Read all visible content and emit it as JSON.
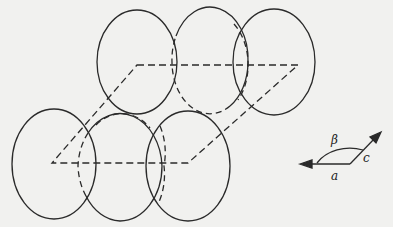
{
  "diagram": {
    "colors": {
      "background": "#f1f1ef",
      "stroke": "#2a2a2a"
    },
    "ellipses": [
      {
        "id": "top-left",
        "cx": 137,
        "cy": 62,
        "rx": 40,
        "ry": 52,
        "hidden_arc": false
      },
      {
        "id": "top-middle",
        "cx": 210,
        "cy": 62,
        "rx": 38,
        "ry": 52,
        "hidden_arc": true
      },
      {
        "id": "top-right",
        "cx": 274,
        "cy": 62,
        "rx": 41,
        "ry": 53,
        "hidden_arc": false
      },
      {
        "id": "bottom-left",
        "cx": 54,
        "cy": 164,
        "rx": 42,
        "ry": 55,
        "hidden_arc": false
      },
      {
        "id": "bottom-middle",
        "cx": 120,
        "cy": 166,
        "rx": 42,
        "ry": 55,
        "hidden_arc": true
      },
      {
        "id": "bottom-right",
        "cx": 188,
        "cy": 166,
        "rx": 42,
        "ry": 55,
        "hidden_arc": false
      }
    ],
    "unit_cell": {
      "style": "dashed",
      "points": [
        [
          137,
          65
        ],
        [
          298,
          65
        ],
        [
          188,
          163
        ],
        [
          52,
          163
        ]
      ]
    },
    "axes_inset": {
      "labels": {
        "a": "a",
        "c": "c",
        "angle": "β"
      },
      "origin": [
        350,
        164
      ],
      "a_tip": [
        302,
        164
      ],
      "c_tip": [
        380,
        133
      ]
    }
  }
}
